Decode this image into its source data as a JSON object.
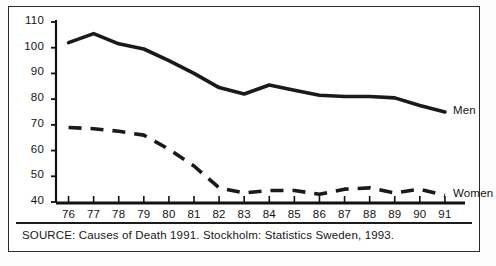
{
  "figure": {
    "source_note": "SOURCE: Causes of Death 1991. Stockholm: Statistics Sweden, 1993.",
    "line_color": "#1a1a1a",
    "axis_color": "#111111",
    "background_color": "#ffffff"
  },
  "chart_data": {
    "type": "line",
    "title": "",
    "subtitle": "",
    "xlabel": "",
    "ylabel": "",
    "xlim": [
      75.5,
      91.8
    ],
    "ylim": [
      40,
      110
    ],
    "grid": false,
    "legend_position": "right-inline",
    "categories": [
      "76",
      "77",
      "78",
      "79",
      "80",
      "81",
      "82",
      "83",
      "84",
      "85",
      "86",
      "87",
      "88",
      "89",
      "90",
      "91"
    ],
    "x": [
      76,
      77,
      78,
      79,
      80,
      81,
      82,
      83,
      84,
      85,
      86,
      87,
      88,
      89,
      90,
      91
    ],
    "yticks": [
      40,
      50,
      60,
      70,
      80,
      90,
      100,
      110
    ],
    "ytick_labels": [
      "40",
      "50",
      "60",
      "70",
      "80",
      "90",
      "100",
      "110"
    ],
    "xtick_labels": [
      "76",
      "77",
      "78",
      "79",
      "80",
      "81",
      "82",
      "83",
      "84",
      "85",
      "86",
      "87",
      "88",
      "89",
      "90",
      "91"
    ],
    "series": [
      {
        "name": "Men",
        "style": "solid",
        "label": "Men",
        "values": [
          102,
          105.5,
          101.5,
          99.5,
          95,
          90,
          84.5,
          82,
          85.5,
          83.5,
          81.5,
          81,
          81,
          80.5,
          77.5,
          75
        ]
      },
      {
        "name": "Women",
        "style": "dashed",
        "label": "Women",
        "values": [
          69,
          68.5,
          67.5,
          66,
          60.5,
          54,
          45.5,
          43.5,
          44.5,
          44.5,
          43,
          45,
          45.5,
          43.5,
          45,
          42.5
        ]
      }
    ],
    "annotations": [
      {
        "text": "Men",
        "x": 91,
        "y": 75
      },
      {
        "text": "Women",
        "x": 91,
        "y": 42.5
      }
    ]
  }
}
